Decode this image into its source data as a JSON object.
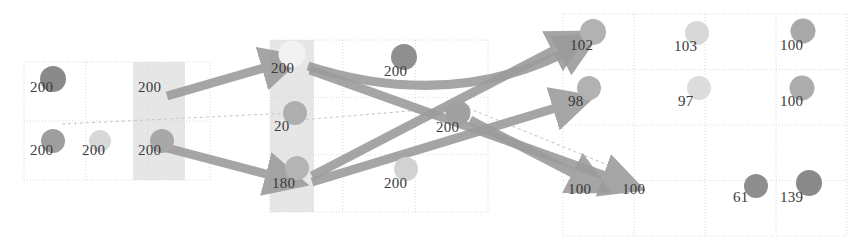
{
  "diagram": {
    "background_color": "#ffffff",
    "grid_line_color": "#d9d9d9",
    "shaded_panel_color": "#e2e2e2",
    "arrow_color": "#9c9c9c",
    "thin_line_color": "#c9c9c9",
    "label_color": "#3a3a3a",
    "panels": [
      {
        "name": "left-grid",
        "x": 24,
        "y": 62,
        "w": 186,
        "h": 118,
        "cols": 3,
        "rows": 2
      },
      {
        "name": "center-grid",
        "x": 270,
        "y": 40,
        "w": 218,
        "h": 172,
        "cols": 3,
        "rows": 3
      },
      {
        "name": "right-grid",
        "x": 563,
        "y": 14,
        "w": 284,
        "h": 222,
        "cols": 4,
        "rows": 4
      }
    ],
    "shaded_columns": [
      {
        "name": "shaded-column-left",
        "x": 133,
        "y": 62,
        "w": 52,
        "h": 118
      },
      {
        "name": "shaded-column-center",
        "x": 270,
        "y": 40,
        "w": 44,
        "h": 172
      }
    ],
    "nodes": [
      {
        "id": "n1",
        "label": "200",
        "cx": 53,
        "cy": 79,
        "r": 13,
        "color": "#8a8a8a",
        "label_x": 30,
        "label_y": 92
      },
      {
        "id": "n2",
        "label": "200",
        "cx": 53,
        "cy": 141,
        "r": 12,
        "color": "#9e9e9e",
        "label_x": 30,
        "label_y": 155
      },
      {
        "id": "n3",
        "label": "200",
        "cx": 100,
        "cy": 141,
        "r": 11,
        "color": "#d8d8d8",
        "label_x": 82,
        "label_y": 155
      },
      {
        "id": "n4",
        "label": "200",
        "cx": 158,
        "cy": 78,
        "r": 0,
        "color": "#e2e2e2",
        "label_x": 138,
        "label_y": 92
      },
      {
        "id": "n5",
        "label": "200",
        "cx": 162,
        "cy": 141,
        "r": 12,
        "color": "#a8a8a8",
        "label_x": 138,
        "label_y": 155
      },
      {
        "id": "n6",
        "label": "200",
        "cx": 292,
        "cy": 54,
        "r": 13.5,
        "color": "#f2f2f2",
        "label_x": 271,
        "label_y": 73
      },
      {
        "id": "n7",
        "label": "20",
        "cx": 295,
        "cy": 113,
        "r": 12,
        "color": "#aeaeae",
        "label_x": 274,
        "label_y": 131
      },
      {
        "id": "n8",
        "label": "180",
        "cx": 297,
        "cy": 168,
        "r": 12,
        "color": "#b4b4b4",
        "label_x": 272,
        "label_y": 188
      },
      {
        "id": "n9",
        "label": "200",
        "cx": 404,
        "cy": 57,
        "r": 13,
        "color": "#8f8f8f",
        "label_x": 384,
        "label_y": 76
      },
      {
        "id": "n10",
        "label": "200",
        "cx": 406,
        "cy": 169,
        "r": 12,
        "color": "#d2d2d2",
        "label_x": 384,
        "label_y": 188
      },
      {
        "id": "n11",
        "label": "200",
        "cx": 458,
        "cy": 113,
        "r": 12.5,
        "color": "#a0a0a0",
        "label_x": 436,
        "label_y": 132
      },
      {
        "id": "n12",
        "label": "102",
        "cx": 593,
        "cy": 32,
        "r": 13,
        "color": "#b2b2b2",
        "label_x": 570,
        "label_y": 50
      },
      {
        "id": "n13",
        "label": "98",
        "cx": 589,
        "cy": 88,
        "r": 12,
        "color": "#b2b2b2",
        "label_x": 568,
        "label_y": 106
      },
      {
        "id": "n14",
        "label": "103",
        "cx": 697,
        "cy": 33,
        "r": 12,
        "color": "#d8d8d8",
        "label_x": 674,
        "label_y": 51
      },
      {
        "id": "n15",
        "label": "97",
        "cx": 699,
        "cy": 88,
        "r": 12,
        "color": "#dcdcdc",
        "label_x": 678,
        "label_y": 106
      },
      {
        "id": "n16",
        "label": "100",
        "cx": 803,
        "cy": 31,
        "r": 12.5,
        "color": "#a9a9a9",
        "label_x": 780,
        "label_y": 50
      },
      {
        "id": "n17",
        "label": "100",
        "cx": 802,
        "cy": 88,
        "r": 12.5,
        "color": "#adadad",
        "label_x": 780,
        "label_y": 106
      },
      {
        "id": "n18",
        "label": "100",
        "cx": 586,
        "cy": 176,
        "r": 0,
        "color": "#f0f0f0",
        "label_x": 568,
        "label_y": 194
      },
      {
        "id": "n19",
        "label": "100",
        "cx": 640,
        "cy": 176,
        "r": 0,
        "color": "#f0f0f0",
        "label_x": 622,
        "label_y": 194
      },
      {
        "id": "n20",
        "label": "61",
        "cx": 756,
        "cy": 186,
        "r": 12,
        "color": "#8e8e8e",
        "label_x": 733,
        "label_y": 202
      },
      {
        "id": "n21",
        "label": "139",
        "cx": 809,
        "cy": 183,
        "r": 13,
        "color": "#8a8a8a",
        "label_x": 780,
        "label_y": 202
      }
    ],
    "arrows": [
      {
        "name": "arrow-left-upper",
        "from": [
          167,
          96
        ],
        "to": [
          281,
          63
        ],
        "width": 9
      },
      {
        "name": "arrow-left-lower",
        "from": [
          167,
          148
        ],
        "to": [
          285,
          179
        ],
        "width": 9
      },
      {
        "name": "arrow-top-to-right-102",
        "from": [
          308,
          66
        ],
        "to": [
          578,
          46
        ],
        "width": 9,
        "via": [
          455,
          113
        ]
      },
      {
        "name": "arrow-top-to-bottom-100",
        "from": [
          310,
          70
        ],
        "to": [
          622,
          182
        ],
        "width": 9
      },
      {
        "name": "arrow-bottom-to-102",
        "from": [
          312,
          176
        ],
        "to": [
          570,
          42
        ],
        "width": 9
      },
      {
        "name": "arrow-bottom-to-98",
        "from": [
          312,
          182
        ],
        "to": [
          572,
          103
        ],
        "width": 9
      },
      {
        "name": "arrow-center-to-100",
        "from": [
          470,
          120
        ],
        "to": [
          590,
          182
        ],
        "width": 9
      }
    ],
    "thin_lines": [
      {
        "name": "thin-line-left",
        "from": [
          62,
          124
        ],
        "to": [
          290,
          113
        ]
      },
      {
        "name": "thin-line-center",
        "from": [
          300,
          120
        ],
        "to": [
          470,
          106
        ]
      },
      {
        "name": "thin-line-right",
        "from": [
          468,
          108
        ],
        "to": [
          620,
          170
        ]
      }
    ]
  }
}
